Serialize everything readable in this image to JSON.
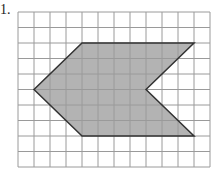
{
  "problem": {
    "label": "1."
  },
  "grid": {
    "origin_px": [
      18,
      12
    ],
    "cell_w_px": 16,
    "cell_h_px": 15.5,
    "cols": 12,
    "rows": 10,
    "line_color": "#9a9a9a"
  },
  "shape": {
    "description": "Chevron-like hexagon pointing left with a notch on the right",
    "vertices_grid": [
      [
        4,
        2
      ],
      [
        11,
        2
      ],
      [
        8,
        5
      ],
      [
        11,
        8
      ],
      [
        4,
        8
      ],
      [
        1,
        5
      ]
    ],
    "fill": "#b3b3b3",
    "stroke": "#333333"
  }
}
